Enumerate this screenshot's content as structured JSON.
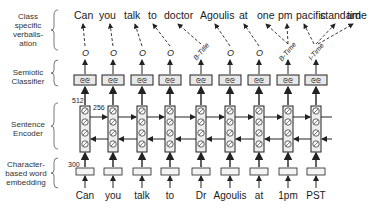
{
  "layers": [
    {
      "label_lines": [
        "Class",
        "specific",
        "verbalis-",
        "ation"
      ]
    },
    {
      "label_lines": [
        "Semiotic",
        "Classifier"
      ]
    },
    {
      "label_lines": [
        "Sentence",
        "Encoder"
      ]
    },
    {
      "label_lines": [
        "Character-",
        "based word",
        "embedding"
      ]
    }
  ],
  "input_tokens": [
    "Can",
    "you",
    "talk",
    "to",
    "Dr",
    "Agoulis",
    "at",
    "1pm",
    "PST"
  ],
  "class_tags": [
    "O",
    "O",
    "O",
    "O",
    "B-Title",
    "O",
    "O",
    "B-Time",
    "I-Time"
  ],
  "output_words": [
    "Can",
    "you",
    "talk",
    "to",
    "doctor",
    "Agoulis",
    "at",
    "one",
    "pm",
    "pacific",
    "standard",
    "time"
  ],
  "dimensions": {
    "classifier_in": "512",
    "encoder_hidden": "256",
    "embedding": "300"
  },
  "colors": {
    "line": "#222222",
    "box_fill": "#f4f4f4",
    "text": "#1a1a1a"
  }
}
